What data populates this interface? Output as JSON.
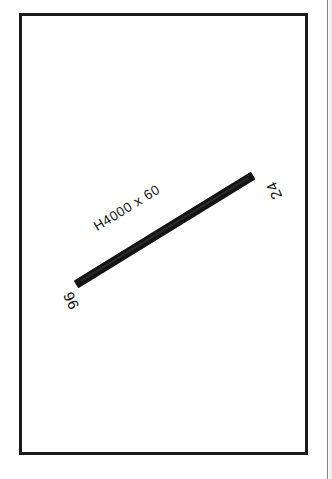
{
  "drawing": {
    "frame": {
      "name": "drawing-border"
    },
    "member": {
      "size_label": "H4000 x 60",
      "start_node_label": "96",
      "end_node_label": "24",
      "color": "#141414"
    },
    "page": {
      "background": "#ffffff",
      "ink_color": "#1b1b1b"
    }
  }
}
